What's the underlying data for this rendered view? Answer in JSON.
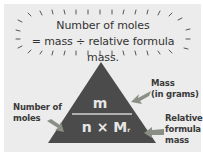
{
  "bubble": {
    "line1": "Number of  moles",
    "line2": "= mass ÷ relative formula mass."
  },
  "triangle": {
    "top": "m",
    "bottom_n": "n",
    "bottom_times": "×",
    "bottom_M": "M",
    "bottom_sub": "r",
    "fill": "#4b4b4b",
    "divider": "#d0d0d0"
  },
  "labels": {
    "mass_line1": "Mass",
    "mass_line2": "(in grams)",
    "moles_line1": "Number of",
    "moles_line2": "moles",
    "rfm_line1": "Relative",
    "rfm_line2": "formula",
    "rfm_line3": "mass"
  },
  "colors": {
    "background": "#ececec",
    "arrow": "#8a8f86"
  }
}
